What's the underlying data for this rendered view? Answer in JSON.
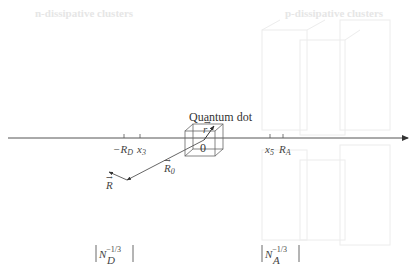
{
  "headers": {
    "left": "n-dissipative clusters",
    "right": "p-dissipative clusters"
  },
  "quantum_dot": {
    "label": "Quantum dot",
    "origin": "0",
    "r_vector": "r"
  },
  "axis": {
    "ticks": [
      {
        "label": "−R",
        "sub": "D",
        "x": 123
      },
      {
        "label": "x",
        "sub": "3",
        "x": 139
      },
      {
        "label": "x",
        "sub": "5",
        "x": 270
      },
      {
        "label": "R",
        "sub": "A",
        "x": 283
      }
    ]
  },
  "vectors": {
    "R0": {
      "label": "R",
      "sub": "0"
    },
    "R": {
      "label": "R"
    }
  },
  "densities": {
    "donor": {
      "base": "N",
      "sub": "D",
      "sup": "−1/3"
    },
    "acceptor": {
      "base": "N",
      "sub": "A",
      "sup": "−1/3"
    }
  },
  "colors": {
    "line": "#555555",
    "faint": "#e8e8e8"
  }
}
